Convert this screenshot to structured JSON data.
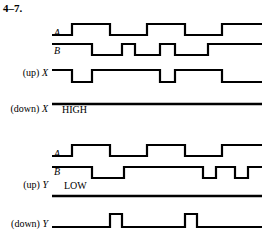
{
  "figure": {
    "problem_number": "4–7.",
    "width": 265,
    "height": 238,
    "stroke_color": "#000000",
    "background_color": "#ffffff"
  },
  "groups": [
    {
      "id": "group-x",
      "signals": [
        {
          "id": "top-a",
          "label_prefix": "",
          "label_name": "A",
          "label_x": 60,
          "label_y": 37,
          "baseline_y": 35,
          "high_y": 24,
          "x_start": 52,
          "x_end": 262,
          "start_level": "low",
          "transitions": [
            72,
            110,
            147,
            185,
            222
          ],
          "level_text": "",
          "flat": false
        },
        {
          "id": "top-b",
          "label_prefix": "",
          "label_name": "B",
          "label_x": 60,
          "label_y": 55,
          "baseline_y": 55,
          "high_y": 44,
          "x_start": 52,
          "x_end": 262,
          "start_level": "high",
          "transitions": [
            92,
            122,
            135,
            160,
            175,
            208
          ],
          "level_text": "",
          "flat": false
        },
        {
          "id": "top-up-x",
          "label_prefix": "(up) ",
          "label_name": "X",
          "label_x": 48,
          "label_y": 77,
          "baseline_y": 82,
          "high_y": 70,
          "x_start": 52,
          "x_end": 262,
          "start_level": "high",
          "transitions": [
            72,
            92,
            160,
            175,
            222
          ],
          "level_text": "",
          "flat": false
        },
        {
          "id": "top-down-x",
          "label_prefix": "(down) ",
          "label_name": "X",
          "label_x": 48,
          "label_y": 113,
          "baseline_y": 104,
          "high_y": 104,
          "x_start": 52,
          "x_end": 262,
          "start_level": "low",
          "transitions": [],
          "level_text": "HIGH",
          "level_text_x": 62,
          "level_text_y": 114,
          "flat": true
        }
      ]
    },
    {
      "id": "group-y",
      "signals": [
        {
          "id": "bot-a",
          "label_prefix": "",
          "label_name": "A",
          "label_x": 60,
          "label_y": 158,
          "baseline_y": 156,
          "high_y": 145,
          "x_start": 52,
          "x_end": 262,
          "start_level": "low",
          "transitions": [
            72,
            110,
            147,
            185,
            222
          ],
          "level_text": "",
          "flat": false
        },
        {
          "id": "bot-b",
          "label_prefix": "",
          "label_name": "B",
          "label_x": 60,
          "label_y": 176,
          "baseline_y": 178,
          "high_y": 167,
          "x_start": 52,
          "x_end": 262,
          "start_level": "high",
          "transitions": [
            92,
            124,
            203,
            216,
            235,
            248
          ],
          "level_text": "",
          "flat": false
        },
        {
          "id": "bot-up-y",
          "label_prefix": "(up) ",
          "label_name": "Y",
          "label_x": 48,
          "label_y": 189,
          "baseline_y": 196,
          "high_y": 196,
          "x_start": 52,
          "x_end": 262,
          "start_level": "low",
          "transitions": [],
          "level_text": "LOW",
          "level_text_x": 64,
          "level_text_y": 190,
          "flat": true
        },
        {
          "id": "bot-down-y",
          "label_prefix": "(down) ",
          "label_name": "Y",
          "label_x": 48,
          "label_y": 228,
          "baseline_y": 227,
          "high_y": 214,
          "x_start": 52,
          "x_end": 262,
          "start_level": "low",
          "transitions": [
            110,
            122,
            185,
            197
          ],
          "level_text": "",
          "flat": false
        }
      ]
    }
  ]
}
